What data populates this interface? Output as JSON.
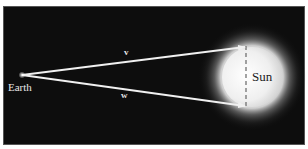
{
  "diagram": {
    "background_color": "#0d0d0d",
    "line_color": "#f0f0f0",
    "labels": {
      "earth": "Earth",
      "sun": "Sun",
      "vector_v": "v",
      "vector_w": "w"
    },
    "elements": [
      {
        "id": "earth",
        "type": "point",
        "label": "Earth"
      },
      {
        "id": "sun",
        "type": "glowing-circle",
        "label": "Sun"
      },
      {
        "id": "v",
        "type": "arrow",
        "from": "earth",
        "to": "sun-top-edge",
        "label": "v"
      },
      {
        "id": "w",
        "type": "arrow",
        "from": "earth",
        "to": "sun-bottom-edge",
        "label": "w"
      },
      {
        "id": "diameter",
        "type": "dashed-line",
        "between": [
          "v-tip",
          "w-tip"
        ]
      }
    ]
  }
}
